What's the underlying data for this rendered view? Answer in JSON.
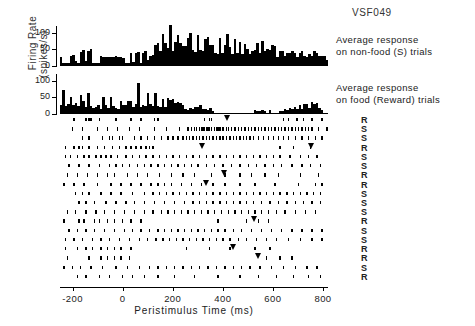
{
  "figure": {
    "title": "VSF049",
    "ylabel_line1": "Firing  Rate",
    "ylabel_line2": "(spikes/s)",
    "xlabel": "Peristimulus  Time   (ms)"
  },
  "annotations": {
    "top_line1": "Average  response",
    "top_line2": "on non-food (S) trials",
    "bottom_line1": "Average  response",
    "bottom_line2": "on food (Reward) trials"
  },
  "yaxis": {
    "ticks": [
      "100",
      "50",
      "0"
    ],
    "min": 0,
    "max": 120
  },
  "xaxis": {
    "ticks": [
      "-200",
      "0",
      "200",
      "400",
      "600",
      "800"
    ],
    "min": -250,
    "max": 820
  },
  "trial_labels": [
    "R",
    "S",
    "S",
    "R",
    "S",
    "S",
    "R",
    "R",
    "S",
    "S",
    "R",
    "S",
    "S",
    "R",
    "R",
    "S",
    "R",
    "S"
  ],
  "chart_data": {
    "type": "bar",
    "title": "VSF049",
    "xlabel": "Peristimulus Time (ms)",
    "ylabel": "Firing Rate (spikes/s)",
    "ylim": [
      0,
      120
    ],
    "xlim": [
      -250,
      820
    ],
    "bin_ms": 10,
    "grid": false,
    "legend_position": "right",
    "series": [
      {
        "name": "Average response on non-food (S) trials",
        "label": "non-food (S)",
        "color": "#000000",
        "values": [
          28,
          10,
          8,
          8,
          30,
          34,
          14,
          10,
          42,
          48,
          14,
          44,
          50,
          8,
          10,
          10,
          30,
          28,
          28,
          28,
          28,
          28,
          30,
          28,
          28,
          24,
          8,
          10,
          38,
          12,
          38,
          42,
          10,
          40,
          46,
          18,
          30,
          32,
          62,
          68,
          44,
          96,
          68,
          54,
          122,
          44,
          72,
          92,
          70,
          60,
          60,
          84,
          100,
          48,
          42,
          94,
          48,
          44,
          80,
          88,
          64,
          64,
          40,
          36,
          84,
          40,
          62,
          96,
          58,
          36,
          82,
          40,
          72,
          36,
          66,
          52,
          36,
          46,
          48,
          70,
          40,
          74,
          46,
          52,
          48,
          64,
          60,
          28,
          44,
          44,
          30,
          40,
          40,
          44,
          40,
          26,
          38,
          44,
          30,
          28,
          36,
          30,
          44,
          38,
          30,
          30,
          30,
          18
        ]
      },
      {
        "name": "Average response on food (Reward) trials",
        "label": "food (Reward)",
        "color": "#000000",
        "values": [
          28,
          72,
          24,
          30,
          52,
          28,
          34,
          24,
          58,
          40,
          20,
          62,
          24,
          18,
          22,
          28,
          14,
          50,
          26,
          18,
          50,
          24,
          18,
          16,
          40,
          26,
          28,
          38,
          40,
          20,
          30,
          94,
          22,
          26,
          24,
          62,
          30,
          24,
          62,
          24,
          20,
          46,
          20,
          48,
          42,
          46,
          34,
          36,
          32,
          26,
          14,
          12,
          18,
          14,
          22,
          22,
          26,
          14,
          14,
          12,
          18,
          10,
          0,
          0,
          0,
          0,
          0,
          0,
          0,
          0,
          0,
          0,
          0,
          0,
          0,
          0,
          0,
          0,
          12,
          10,
          10,
          12,
          10,
          0,
          12,
          0,
          0,
          0,
          10,
          10,
          14,
          12,
          18,
          16,
          22,
          16,
          28,
          14,
          30,
          30,
          18,
          36,
          30,
          32,
          18,
          12,
          0,
          0
        ]
      }
    ]
  },
  "raster_data": {
    "description": "Spike raster, 18 trials, each dot a spike; inverted triangles mark behavioural response",
    "rows": [
      {
        "label": "R",
        "spikes": [
          16,
          30,
          34,
          36,
          46,
          66,
          84,
          96,
          112,
          116,
          172,
          178,
          180,
          266,
          272,
          282,
          290,
          300,
          312
        ],
        "markers": [
          199
        ]
      },
      {
        "label": "S",
        "spikes": [
          14,
          26,
          44,
          56,
          68,
          82,
          94,
          112,
          126,
          142,
          152,
          156,
          160,
          162,
          166,
          168,
          170,
          172,
          174,
          176,
          178,
          180,
          184,
          186,
          188,
          190,
          194,
          198,
          200,
          204,
          208,
          212,
          216,
          220,
          224,
          228,
          232,
          236,
          240,
          244,
          248,
          252,
          256,
          260,
          264,
          268,
          272,
          276,
          280,
          284,
          288,
          292,
          296,
          300,
          308,
          318
        ],
        "markers": []
      },
      {
        "label": "S",
        "spikes": [
          26,
          34,
          50,
          58,
          62,
          70,
          74,
          88,
          96,
          104,
          112,
          120,
          128,
          134,
          140,
          146,
          150,
          154,
          158,
          162,
          166,
          170,
          174,
          178,
          182,
          186,
          190,
          194,
          198,
          202,
          206,
          210,
          214,
          218,
          222,
          226,
          230,
          236,
          242,
          248,
          254,
          260,
          266,
          272,
          280,
          288,
          296,
          304,
          312
        ],
        "markers": []
      },
      {
        "label": "R",
        "spikes": [
          6,
          16,
          22,
          26,
          34,
          44,
          52,
          62,
          70,
          78,
          84,
          90,
          96,
          102,
          106,
          110,
          262,
          278,
          298
        ],
        "markers": [
          170,
          300
        ]
      },
      {
        "label": "S",
        "spikes": [
          6,
          12,
          20,
          28,
          34,
          42,
          48,
          54,
          60,
          68,
          78,
          86,
          94,
          102,
          110,
          118,
          126,
          134,
          142,
          150,
          158,
          166,
          174,
          182,
          190,
          198,
          206,
          214,
          222,
          230,
          238,
          246,
          254,
          262,
          274,
          286,
          296,
          306
        ],
        "markers": []
      },
      {
        "label": "S",
        "spikes": [
          10,
          22,
          34,
          46,
          58,
          66,
          74,
          82,
          92,
          100,
          108,
          116,
          124,
          132,
          140,
          148,
          156,
          164,
          174,
          184,
          194,
          204,
          214,
          224,
          234,
          244,
          254,
          264,
          276,
          288,
          298,
          310
        ],
        "markers": []
      },
      {
        "label": "R",
        "spikes": [
          8,
          20,
          32,
          44,
          56,
          64,
          80,
          92,
          104,
          118,
          132,
          146,
          160,
          180,
          196,
          214,
          228,
          244,
          260,
          286,
          308
        ],
        "markers": [
          196
        ]
      },
      {
        "label": "R",
        "spikes": [
          4,
          16,
          28,
          44,
          60,
          72,
          84,
          96,
          108,
          116,
          124,
          132,
          144,
          156,
          168,
          182,
          196,
          214,
          232,
          256,
          284,
          304,
          312
        ],
        "markers": [
          174
        ]
      },
      {
        "label": "S",
        "spikes": [
          18,
          26,
          34,
          48,
          60,
          72,
          86,
          100,
          110,
          118,
          126,
          134,
          142,
          150,
          158,
          166,
          174,
          182,
          190,
          198,
          206,
          214,
          222,
          230,
          238,
          246,
          254,
          262,
          270,
          278,
          286,
          294,
          302,
          310
        ],
        "markers": []
      },
      {
        "label": "S",
        "spikes": [
          22,
          30,
          40,
          54,
          66,
          78,
          88,
          100,
          112,
          124,
          136,
          148,
          158,
          166,
          174,
          182,
          190,
          198,
          206,
          214,
          222,
          230,
          240,
          250,
          260,
          270,
          280,
          290,
          300,
          310
        ],
        "markers": []
      },
      {
        "label": "S",
        "spikes": [
          8,
          18,
          30,
          42,
          52,
          64,
          76,
          88,
          100,
          110,
          120,
          128,
          136,
          144,
          152,
          160,
          168,
          176,
          184,
          192,
          200,
          208,
          216,
          224,
          232,
          240,
          248,
          258,
          268,
          280,
          292,
          304
        ],
        "markers": []
      },
      {
        "label": "R",
        "spikes": [
          4,
          22,
          28,
          40,
          46,
          56,
          64,
          74,
          84,
          96,
          188,
          222,
          236,
          248
        ],
        "markers": [
          232
        ]
      },
      {
        "label": "S",
        "spikes": [
          10,
          20,
          30,
          40,
          52,
          64,
          76,
          86,
          96,
          106,
          116,
          124,
          132,
          140,
          148,
          156,
          164,
          172,
          180,
          188,
          196,
          206,
          216,
          228,
          240,
          252,
          264,
          276,
          288,
          300,
          312
        ],
        "markers": []
      },
      {
        "label": "S",
        "spikes": [
          6,
          16,
          26,
          38,
          48,
          58,
          70,
          82,
          94,
          104,
          114,
          122,
          130,
          138,
          146,
          154,
          162,
          170,
          178,
          186,
          194,
          202,
          212,
          222,
          234,
          246,
          258,
          272,
          286,
          300,
          312
        ],
        "markers": []
      },
      {
        "label": "R",
        "spikes": [
          6,
          20,
          30,
          38,
          48,
          56,
          64,
          72,
          84,
          150,
          178,
          202,
          232,
          250
        ],
        "markers": [
          206
        ]
      },
      {
        "label": "R",
        "spikes": [
          8,
          34,
          48,
          56,
          64,
          72,
          82,
          246,
          262,
          276
        ],
        "markers": [
          236
        ]
      },
      {
        "label": "S",
        "spikes": [
          4,
          14,
          24,
          36,
          50,
          66,
          80,
          94,
          106,
          116,
          126,
          136,
          146,
          156,
          166,
          176,
          186,
          196,
          206,
          216,
          226,
          238,
          252,
          266,
          280,
          294,
          306
        ],
        "markers": []
      },
      {
        "label": "R",
        "spikes": [
          20,
          30,
          46,
          58,
          74,
          86,
          100,
          116,
          136,
          160,
          188,
          214,
          236,
          258,
          278,
          296,
          310
        ],
        "markers": []
      }
    ]
  }
}
